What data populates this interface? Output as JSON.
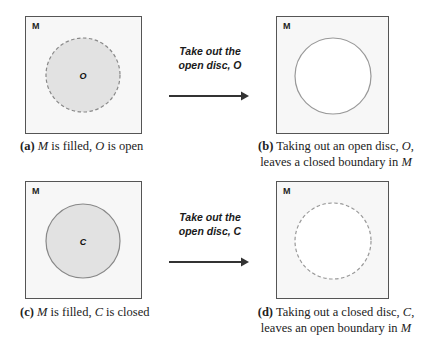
{
  "panels": {
    "a": {
      "space_label": "M",
      "disc_label": "O",
      "disc_fill": "#e2e2e2",
      "disc_boundary": "dashed",
      "caption_tag": "(a)",
      "caption_m": "M",
      "caption_mid": " is filled, ",
      "caption_var": "O",
      "caption_end": " is open"
    },
    "b": {
      "space_label": "M",
      "disc_fill": "#ffffff",
      "disc_boundary": "solid",
      "caption_tag": "(b)",
      "caption_line1_text": " Taking out an open disc, ",
      "caption_line1_var": "O",
      "caption_line1_end": ",",
      "caption_line2_text": "leaves a closed boundary in ",
      "caption_line2_var": "M"
    },
    "c": {
      "space_label": "M",
      "disc_label": "C",
      "disc_fill": "#e2e2e2",
      "disc_boundary": "solid",
      "caption_tag": "(c)",
      "caption_m": "M",
      "caption_mid": " is filled, ",
      "caption_var": "C",
      "caption_end": " is closed"
    },
    "d": {
      "space_label": "M",
      "disc_fill": "#ffffff",
      "disc_boundary": "dashed",
      "caption_tag": "(d)",
      "caption_line1_text": " Taking out a closed disc, ",
      "caption_line1_var": "C",
      "caption_line1_end": ",",
      "caption_line2_text": "leaves an open boundary in ",
      "caption_line2_var": "M"
    }
  },
  "actions": {
    "top": {
      "line1": "Take out the",
      "line2": "open disc, O"
    },
    "bottom": {
      "line1": "Take out the",
      "line2": "open disc, C"
    }
  },
  "colors": {
    "box_border": "#555555",
    "disc_stroke": "#888888",
    "arrow": "#333333"
  }
}
